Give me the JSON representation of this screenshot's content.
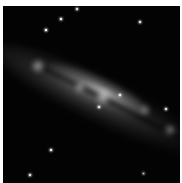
{
  "image": {
    "subject": "edge-on spiral galaxy",
    "background_color": "#030303",
    "frame_color": "#ffffff",
    "galaxy": {
      "orientation_deg": 26,
      "core_center": [
        100,
        95
      ],
      "knots": [
        {
          "x": 38,
          "y": 66,
          "r": 7,
          "brightness": 0.6
        },
        {
          "x": 80,
          "y": 87,
          "r": 6,
          "brightness": 0.55
        },
        {
          "x": 103,
          "y": 97,
          "r": 8,
          "brightness": 0.7
        },
        {
          "x": 170,
          "y": 130,
          "r": 6,
          "brightness": 0.45
        },
        {
          "x": 145,
          "y": 110,
          "r": 6,
          "brightness": 0.35
        }
      ]
    },
    "stars": [
      {
        "x": 77,
        "y": 9,
        "size": 2
      },
      {
        "x": 61,
        "y": 19,
        "size": 1.5
      },
      {
        "x": 140,
        "y": 22,
        "size": 2.5
      },
      {
        "x": 46,
        "y": 30,
        "size": 1.2
      },
      {
        "x": 120,
        "y": 95,
        "size": 2.5
      },
      {
        "x": 166,
        "y": 109,
        "size": 2.5
      },
      {
        "x": 99,
        "y": 107,
        "size": 2
      },
      {
        "x": 51,
        "y": 150,
        "size": 1.5
      },
      {
        "x": 30,
        "y": 175,
        "size": 2.5
      },
      {
        "x": 143,
        "y": 173,
        "size": 1
      }
    ]
  }
}
